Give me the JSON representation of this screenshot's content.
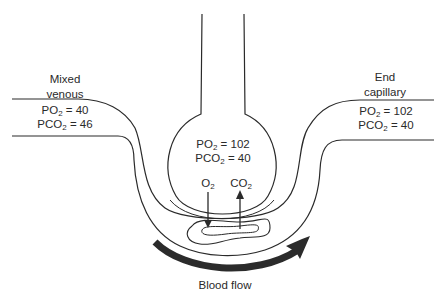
{
  "diagram": {
    "mixed_venous": {
      "label_line1": "Mixed",
      "label_line2": "venous",
      "po2_prefix": "PO",
      "po2_sub": "2",
      "po2_value": " = 40",
      "pco2_prefix": "PCO",
      "pco2_sub": "2",
      "pco2_value": " = 46"
    },
    "alveolus": {
      "po2_prefix": "PO",
      "po2_sub": "2",
      "po2_value": " = 102",
      "pco2_prefix": "PCO",
      "pco2_sub": "2",
      "pco2_value": " = 40",
      "o2_prefix": "O",
      "o2_sub": "2",
      "co2_prefix": "CO",
      "co2_sub": "2"
    },
    "end_capillary": {
      "label_line1": "End",
      "label_line2": "capillary",
      "po2_prefix": "PO",
      "po2_sub": "2",
      "po2_value": " = 102",
      "pco2_prefix": "PCO",
      "pco2_sub": "2",
      "pco2_value": " = 40"
    },
    "flow_label": "Blood flow",
    "colors": {
      "line": "#2a2a2a",
      "arrow": "#2b2b2b",
      "background": "#ffffff"
    }
  }
}
